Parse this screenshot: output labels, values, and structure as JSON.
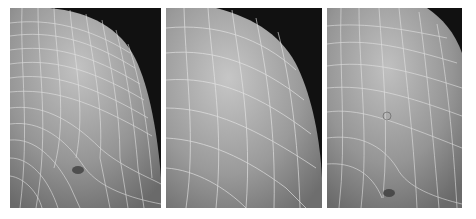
{
  "figure": {
    "panels": [
      {
        "id": "panel-1",
        "label": "",
        "mesh_density": "dense",
        "feature": "pinched vertex near lower-middle"
      },
      {
        "id": "panel-2",
        "label": "",
        "mesh_density": "coarse",
        "feature": "smooth regular grid"
      },
      {
        "id": "panel-3",
        "label": "",
        "mesh_density": "medium",
        "feature": "irregular vertices and seam near center"
      }
    ],
    "colors": {
      "background": "#ffffff",
      "scene_background": "#111111",
      "surface_light": "#b4b4b4",
      "surface_dark": "#6a6a6a",
      "mesh_lines": "#e6e6e6"
    }
  }
}
